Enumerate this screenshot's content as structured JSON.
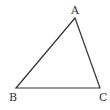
{
  "diagram": {
    "type": "triangle",
    "stroke_color": "#333333",
    "background": "#ffffff",
    "vertices": [
      {
        "label": "A",
        "x": 75,
        "y": 18
      },
      {
        "label": "B",
        "x": 16,
        "y": 88
      },
      {
        "label": "C",
        "x": 100,
        "y": 88
      }
    ],
    "edges": [
      [
        "A",
        "B"
      ],
      [
        "B",
        "C"
      ],
      [
        "C",
        "A"
      ]
    ]
  }
}
